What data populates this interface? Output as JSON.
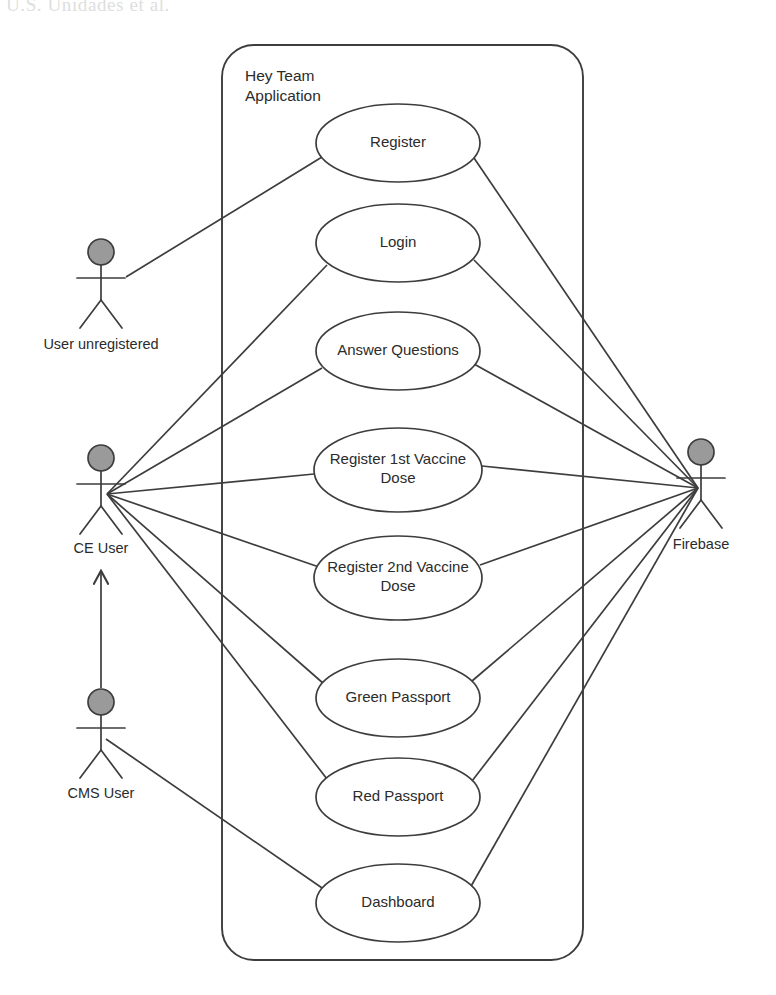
{
  "page": {
    "bleed_text": "U.S.  Unidades  et  al.",
    "background_color": "#ffffff",
    "line_color": "#3d3d3d",
    "actor_head_fill": "#9a9a9a"
  },
  "system_boundary": {
    "label_line1": "Hey Team",
    "label_line2": "Application",
    "x": 222,
    "y": 45,
    "width": 361,
    "height": 915,
    "radius": 32
  },
  "actors": [
    {
      "id": "user-unregistered",
      "label": "User unregistered",
      "x": 101,
      "y": 252,
      "label_x": 101,
      "label_y": 349,
      "anchor_x": 126,
      "anchor_y": 277
    },
    {
      "id": "ce-user",
      "label": "CE User",
      "x": 101,
      "y": 458,
      "label_x": 101,
      "label_y": 553,
      "anchor_x": 107,
      "anchor_y": 494
    },
    {
      "id": "cms-user",
      "label": "CMS User",
      "x": 101,
      "y": 702,
      "label_x": 101,
      "label_y": 798,
      "anchor_x": 106,
      "anchor_y": 739
    },
    {
      "id": "firebase",
      "label": "Firebase",
      "x": 701,
      "y": 452,
      "label_x": 701,
      "label_y": 549,
      "anchor_x": 698,
      "anchor_y": 488
    }
  ],
  "use_cases": [
    {
      "id": "register",
      "label": "Register",
      "cx": 398,
      "cy": 143,
      "rx": 82,
      "ry": 39,
      "lines": [
        "Register"
      ]
    },
    {
      "id": "login",
      "label": "Login",
      "cx": 398,
      "cy": 243,
      "rx": 82,
      "ry": 39,
      "lines": [
        "Login"
      ]
    },
    {
      "id": "answer-questions",
      "label": "Answer Questions",
      "cx": 398,
      "cy": 351,
      "rx": 82,
      "ry": 39,
      "lines": [
        "Answer Questions"
      ]
    },
    {
      "id": "register-1st-dose",
      "label": "Register 1st Vaccine Dose",
      "cx": 398,
      "cy": 470,
      "rx": 84,
      "ry": 42,
      "lines": [
        "Register 1st Vaccine",
        "Dose"
      ]
    },
    {
      "id": "register-2nd-dose",
      "label": "Register 2nd Vaccine Dose",
      "cx": 398,
      "cy": 578,
      "rx": 84,
      "ry": 42,
      "lines": [
        "Register 2nd Vaccine",
        "Dose"
      ]
    },
    {
      "id": "green-passport",
      "label": "Green Passport",
      "cx": 398,
      "cy": 698,
      "rx": 82,
      "ry": 39,
      "lines": [
        "Green Passport"
      ]
    },
    {
      "id": "red-passport",
      "label": "Red Passport",
      "cx": 398,
      "cy": 797,
      "rx": 82,
      "ry": 39,
      "lines": [
        "Red Passport"
      ]
    },
    {
      "id": "dashboard",
      "label": "Dashboard",
      "cx": 398,
      "cy": 903,
      "rx": 82,
      "ry": 39,
      "lines": [
        "Dashboard"
      ]
    }
  ],
  "associations": [
    {
      "id": "unreg-register",
      "from": "user-unregistered",
      "to": "register",
      "x1": 126,
      "y1": 277,
      "x2": 322,
      "y2": 157
    },
    {
      "id": "ce-login",
      "from": "ce-user",
      "to": "login",
      "x1": 107,
      "y1": 494,
      "x2": 327,
      "y2": 265
    },
    {
      "id": "ce-answer-questions",
      "from": "ce-user",
      "to": "answer-questions",
      "x1": 107,
      "y1": 494,
      "x2": 322,
      "y2": 368
    },
    {
      "id": "ce-register-1st",
      "from": "ce-user",
      "to": "register-1st-dose",
      "x1": 107,
      "y1": 494,
      "x2": 314,
      "y2": 474
    },
    {
      "id": "ce-register-2nd",
      "from": "ce-user",
      "to": "register-2nd-dose",
      "x1": 107,
      "y1": 494,
      "x2": 319,
      "y2": 567
    },
    {
      "id": "ce-green-passport",
      "from": "ce-user",
      "to": "green-passport",
      "x1": 107,
      "y1": 494,
      "x2": 324,
      "y2": 684
    },
    {
      "id": "ce-red-passport",
      "from": "ce-user",
      "to": "red-passport",
      "x1": 107,
      "y1": 494,
      "x2": 327,
      "y2": 779
    },
    {
      "id": "cms-dashboard",
      "from": "cms-user",
      "to": "dashboard",
      "x1": 106,
      "y1": 739,
      "x2": 325,
      "y2": 890
    },
    {
      "id": "register-firebase",
      "from": "register",
      "to": "firebase",
      "x1": 474,
      "y1": 158,
      "x2": 698,
      "y2": 488
    },
    {
      "id": "login-firebase",
      "from": "login",
      "to": "firebase",
      "x1": 474,
      "y1": 260,
      "x2": 698,
      "y2": 488
    },
    {
      "id": "answer-firebase",
      "from": "answer-questions",
      "to": "firebase",
      "x1": 474,
      "y1": 364,
      "x2": 698,
      "y2": 488
    },
    {
      "id": "reg1st-firebase",
      "from": "register-1st-dose",
      "to": "firebase",
      "x1": 482,
      "y1": 466,
      "x2": 698,
      "y2": 488
    },
    {
      "id": "reg2nd-firebase",
      "from": "register-2nd-dose",
      "to": "firebase",
      "x1": 480,
      "y1": 565,
      "x2": 698,
      "y2": 488
    },
    {
      "id": "green-firebase",
      "from": "green-passport",
      "to": "firebase",
      "x1": 472,
      "y1": 681,
      "x2": 698,
      "y2": 488
    },
    {
      "id": "red-firebase",
      "from": "red-passport",
      "to": "firebase",
      "x1": 472,
      "y1": 781,
      "x2": 698,
      "y2": 488
    },
    {
      "id": "dashboard-firebase",
      "from": "dashboard",
      "to": "firebase",
      "x1": 470,
      "y1": 888,
      "x2": 698,
      "y2": 488
    }
  ],
  "generalizations": [
    {
      "id": "cms-inherits-ce",
      "from": "cms-user",
      "to": "ce-user",
      "x1": 101,
      "y1": 688,
      "x2": 101,
      "y2": 572
    }
  ]
}
